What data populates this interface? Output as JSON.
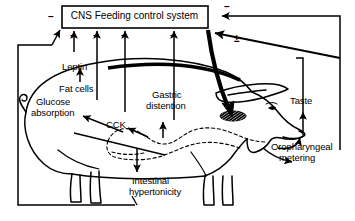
{
  "figure": {
    "title_box": {
      "label": "CNS Feeding control system"
    },
    "nodes": [
      {
        "id": "leptin",
        "label": "Leptin"
      },
      {
        "id": "fat-cells",
        "label": "Fat cells"
      },
      {
        "id": "glucose-absorption",
        "label": "Glucose\nabsorption"
      },
      {
        "id": "glucose-absorption-line1",
        "label": "Glucose"
      },
      {
        "id": "glucose-absorption-line2",
        "label": "absorption"
      },
      {
        "id": "cck",
        "label": "CCK"
      },
      {
        "id": "gastric-distention-line1",
        "label": "Gastric"
      },
      {
        "id": "gastric-distention-line2",
        "label": "distention"
      },
      {
        "id": "intestinal-hypertonicity-line1",
        "label": "Intestinal"
      },
      {
        "id": "intestinal-hypertonicity-line2",
        "label": "hypertonicity"
      },
      {
        "id": "taste",
        "label": "Taste"
      },
      {
        "id": "oropharyngeal-metering-line1",
        "label": "Oropharyngeal"
      },
      {
        "id": "oropharyngeal-metering-line2",
        "label": "metering"
      }
    ],
    "signs": [
      {
        "id": "sign-left-box",
        "symbol": "–"
      },
      {
        "id": "sign-leptin-arrow",
        "symbol": "–"
      },
      {
        "id": "sign-fatcells-arrow",
        "symbol": "–"
      },
      {
        "id": "sign-glucose-arrow",
        "symbol": "–"
      },
      {
        "id": "sign-gastric-arrow",
        "symbol": "–"
      },
      {
        "id": "sign-right-top-box",
        "symbol": "–"
      },
      {
        "id": "sign-plusminus",
        "symbol": "±"
      }
    ],
    "colors": {
      "ink": "#000000",
      "background": "#ffffff"
    }
  }
}
